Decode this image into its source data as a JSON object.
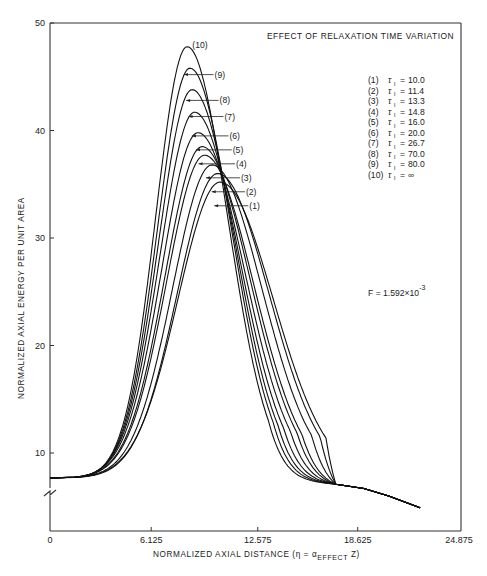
{
  "chart_data": {
    "type": "line",
    "title": "EFFECT OF RELAXATION TIME VARIATION",
    "xlabel": "NORMALIZED AXIAL DISTANCE (η = α_EFFECT Z)",
    "xlabel_parts": {
      "prefix": "NORMALIZED AXIAL DISTANCE  (η = α",
      "sub": "EFFECT",
      "suffix": " Z)"
    },
    "ylabel": "NORMALIZED AXIAL ENERGY PER UNIT AREA",
    "xlim": [
      0,
      24.875
    ],
    "ylim": [
      0,
      50
    ],
    "y_axis_break": true,
    "grid": false,
    "x_ticks": [
      {
        "value": 0,
        "label": "0"
      },
      {
        "value": 6.125,
        "label": "6.125"
      },
      {
        "value": 12.575,
        "label": "12.575"
      },
      {
        "value": 18.625,
        "label": "18.625"
      },
      {
        "value": 24.875,
        "label": "24.875"
      }
    ],
    "y_ticks": [
      {
        "value": 10,
        "label": "10"
      },
      {
        "value": 20,
        "label": "20"
      },
      {
        "value": 30,
        "label": "30"
      },
      {
        "value": 40,
        "label": "40"
      },
      {
        "value": 50,
        "label": "50"
      }
    ],
    "annotation": {
      "text": "F = 1.592×10",
      "exponent": "-3"
    },
    "baseline_value": 7.67,
    "rise_start_x": 3.0,
    "shared_tail": [
      [
        17.3,
        7.1
      ],
      [
        19.0,
        6.7
      ],
      [
        20.5,
        6.0
      ],
      [
        22.4,
        4.9
      ]
    ],
    "legend_position": "upper right",
    "legend": [
      {
        "id": "(1)",
        "symbol": "τ",
        "sub": "l",
        "value": "10.0"
      },
      {
        "id": "(2)",
        "symbol": "τ",
        "sub": "l",
        "value": "11.4"
      },
      {
        "id": "(3)",
        "symbol": "τ",
        "sub": "l",
        "value": "13.3"
      },
      {
        "id": "(4)",
        "symbol": "τ",
        "sub": "l",
        "value": "14.8"
      },
      {
        "id": "(5)",
        "symbol": "τ",
        "sub": "l",
        "value": "16.0"
      },
      {
        "id": "(6)",
        "symbol": "τ",
        "sub": "l",
        "value": "20.0"
      },
      {
        "id": "(7)",
        "symbol": "τ",
        "sub": "l",
        "value": "26.7"
      },
      {
        "id": "(8)",
        "symbol": "τ",
        "sub": "l",
        "value": "70.0"
      },
      {
        "id": "(9)",
        "symbol": "τ",
        "sub": "l",
        "value": "80.0"
      },
      {
        "id": "(10)",
        "symbol": "τ",
        "sub": "l",
        "value": "∞"
      }
    ],
    "series": [
      {
        "name": "(1) τl = 10.0",
        "peak_x": 10.3,
        "peak_y": 35.2,
        "sigma_left": 2.55,
        "sigma_right": 3.2,
        "label_pos": [
          12.0,
          33.0
        ]
      },
      {
        "name": "(2) τl = 11.4",
        "peak_x": 10.15,
        "peak_y": 36.0,
        "sigma_left": 2.45,
        "sigma_right": 3.1,
        "label_pos": [
          11.8,
          34.3
        ]
      },
      {
        "name": "(3) τl = 13.3",
        "peak_x": 9.8,
        "peak_y": 36.8,
        "sigma_left": 2.38,
        "sigma_right": 3.02,
        "label_pos": [
          11.5,
          35.6
        ]
      },
      {
        "name": "(4) τl = 14.8",
        "peak_x": 9.35,
        "peak_y": 37.7,
        "sigma_left": 2.3,
        "sigma_right": 2.95,
        "label_pos": [
          11.2,
          36.9
        ]
      },
      {
        "name": "(5) τl = 16.0",
        "peak_x": 9.2,
        "peak_y": 38.5,
        "sigma_left": 2.25,
        "sigma_right": 2.88,
        "label_pos": [
          11.0,
          38.2
        ]
      },
      {
        "name": "(6) τl = 20.0",
        "peak_x": 8.95,
        "peak_y": 39.8,
        "sigma_left": 2.18,
        "sigma_right": 2.8,
        "label_pos": [
          10.8,
          39.5
        ]
      },
      {
        "name": "(7) τl = 26.7",
        "peak_x": 8.75,
        "peak_y": 41.7,
        "sigma_left": 2.1,
        "sigma_right": 2.7,
        "label_pos": [
          10.5,
          41.3
        ]
      },
      {
        "name": "(8) τl = 70.0",
        "peak_x": 8.6,
        "peak_y": 43.8,
        "sigma_left": 2.03,
        "sigma_right": 2.6,
        "label_pos": [
          10.2,
          42.8
        ]
      },
      {
        "name": "(9) τl = 80.0",
        "peak_x": 8.47,
        "peak_y": 45.8,
        "sigma_left": 1.97,
        "sigma_right": 2.52,
        "label_pos": [
          9.9,
          45.2
        ]
      },
      {
        "name": "(10) τl = ∞",
        "peak_x": 8.3,
        "peak_y": 47.8,
        "sigma_left": 1.9,
        "sigma_right": 2.45,
        "label_pos": [
          8.55,
          48.0
        ]
      }
    ]
  }
}
